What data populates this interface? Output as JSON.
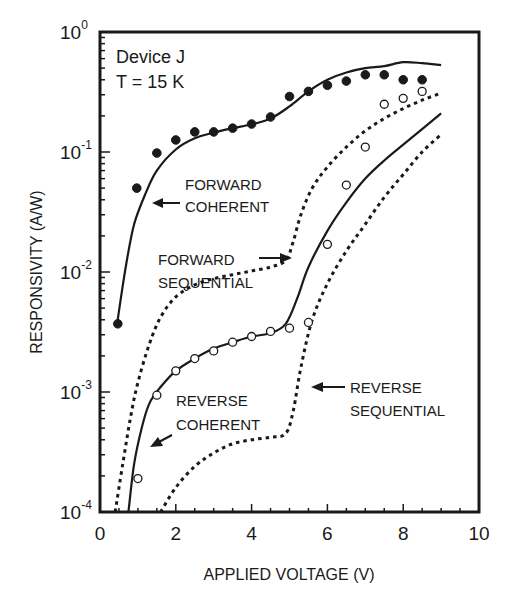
{
  "chart_data": {
    "type": "line",
    "title": "",
    "xlabel": "APPLIED VOLTAGE (V)",
    "ylabel": "RESPONSIVITY (A/W)",
    "xlim": [
      0,
      10
    ],
    "ylim": [
      0.0001,
      1
    ],
    "yscale": "log",
    "xticks": [
      0,
      2,
      4,
      6,
      8,
      10
    ],
    "xtick_labels": [
      "0",
      "2",
      "4",
      "6",
      "8",
      "10"
    ],
    "yticks": [
      1,
      0.1,
      0.01,
      0.001,
      0.0001
    ],
    "ytick_labels": [
      {
        "base": "10",
        "exp": "0"
      },
      {
        "base": "10",
        "exp": "-1"
      },
      {
        "base": "10",
        "exp": "-2"
      },
      {
        "base": "10",
        "exp": "-3"
      },
      {
        "base": "10",
        "exp": "-4"
      }
    ],
    "grid": false,
    "legend": "none (inline annotations)",
    "annotations": {
      "device_line1": "Device J",
      "device_line2": "T = 15 K",
      "forward_coherent": [
        "FORWARD",
        "COHERENT"
      ],
      "forward_sequential": [
        "FORWARD",
        "SEQUENTIAL"
      ],
      "reverse_coherent": [
        "REVERSE",
        "COHERENT"
      ],
      "reverse_sequential": [
        "REVERSE",
        "SEQUENTIAL"
      ]
    },
    "series": [
      {
        "name": "Forward coherent (theory)",
        "style": "solid",
        "x": [
          0.45,
          0.55,
          0.7,
          0.9,
          1.2,
          1.5,
          2.0,
          2.5,
          3.0,
          3.5,
          4.0,
          4.5,
          5.0,
          5.5,
          6.0,
          6.5,
          7.0,
          7.5,
          8.0,
          8.5,
          9.0
        ],
        "y": [
          0.0037,
          0.006,
          0.012,
          0.025,
          0.045,
          0.07,
          0.105,
          0.13,
          0.145,
          0.158,
          0.17,
          0.19,
          0.24,
          0.32,
          0.4,
          0.46,
          0.5,
          0.52,
          0.56,
          0.55,
          0.53
        ]
      },
      {
        "name": "Forward sequential (theory)",
        "style": "dotted",
        "x": [
          0.4,
          0.6,
          0.8,
          1.0,
          1.3,
          1.6,
          2.0,
          2.5,
          3.0,
          3.5,
          4.0,
          4.5,
          4.9,
          5.1,
          5.3,
          5.6,
          6.0,
          6.5,
          7.0,
          7.5,
          8.0,
          8.5,
          9.0
        ],
        "y": [
          0.0001,
          0.00025,
          0.0006,
          0.0012,
          0.0025,
          0.0042,
          0.0062,
          0.0078,
          0.0088,
          0.0095,
          0.0102,
          0.011,
          0.0125,
          0.018,
          0.03,
          0.05,
          0.075,
          0.11,
          0.15,
          0.19,
          0.23,
          0.27,
          0.31
        ]
      },
      {
        "name": "Reverse coherent (theory)",
        "style": "solid",
        "x": [
          0.75,
          0.9,
          1.1,
          1.3,
          1.6,
          2.0,
          2.5,
          3.0,
          3.5,
          4.0,
          4.5,
          4.9,
          5.2,
          5.5,
          6.0,
          6.5,
          7.0,
          7.5,
          8.0,
          8.5,
          9.0
        ],
        "y": [
          0.0001,
          0.00025,
          0.0005,
          0.0008,
          0.0011,
          0.0015,
          0.0019,
          0.0023,
          0.0026,
          0.0029,
          0.0031,
          0.0037,
          0.006,
          0.011,
          0.022,
          0.038,
          0.06,
          0.085,
          0.115,
          0.155,
          0.21
        ]
      },
      {
        "name": "Reverse sequential (theory)",
        "style": "dotted",
        "x": [
          1.6,
          2.0,
          2.5,
          3.0,
          3.5,
          4.0,
          4.5,
          4.9,
          5.1,
          5.3,
          5.6,
          6.0,
          6.5,
          7.0,
          7.5,
          8.0,
          8.5,
          9.0
        ],
        "y": [
          0.0001,
          0.00016,
          0.00024,
          0.00031,
          0.00037,
          0.0004,
          0.00042,
          0.00045,
          0.0007,
          0.0016,
          0.004,
          0.008,
          0.015,
          0.025,
          0.042,
          0.065,
          0.1,
          0.14
        ]
      },
      {
        "name": "Forward (measured)",
        "style": "filled-circle",
        "x": [
          0.47,
          0.97,
          1.5,
          2.0,
          2.5,
          3.0,
          3.5,
          4.0,
          4.5,
          5.0,
          5.5,
          6.0,
          6.5,
          7.0,
          7.5,
          8.0,
          8.5
        ],
        "y": [
          0.0037,
          0.05,
          0.098,
          0.126,
          0.147,
          0.147,
          0.158,
          0.171,
          0.196,
          0.29,
          0.32,
          0.36,
          0.39,
          0.44,
          0.44,
          0.4,
          0.4
        ]
      },
      {
        "name": "Reverse (measured)",
        "style": "open-circle",
        "x": [
          1.0,
          1.5,
          2.0,
          2.5,
          3.0,
          3.5,
          4.0,
          4.5,
          5.0,
          5.5,
          6.0,
          6.5,
          7.0,
          7.5,
          8.0,
          8.5
        ],
        "y": [
          0.00019,
          0.00094,
          0.0015,
          0.0019,
          0.0022,
          0.0026,
          0.0029,
          0.0032,
          0.0034,
          0.0038,
          0.017,
          0.053,
          0.11,
          0.25,
          0.28,
          0.32
        ]
      }
    ]
  },
  "colors": {
    "ink": "#1a1a1a",
    "background": "#ffffff"
  }
}
